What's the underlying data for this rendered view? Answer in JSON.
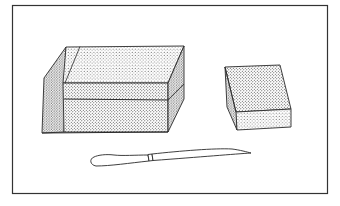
{
  "illustration": {
    "description": "Line drawing of a large stippled block cut with a horizontal seam, a smaller stippled block, and a knife",
    "colors": {
      "background": "#ffffff",
      "ink": "#2a2a2a",
      "stipple": "#3a3a3a",
      "frame": "#333333"
    },
    "objects": [
      {
        "name": "large-block",
        "label": "large block"
      },
      {
        "name": "small-block",
        "label": "small block"
      },
      {
        "name": "knife",
        "label": "knife"
      }
    ]
  }
}
